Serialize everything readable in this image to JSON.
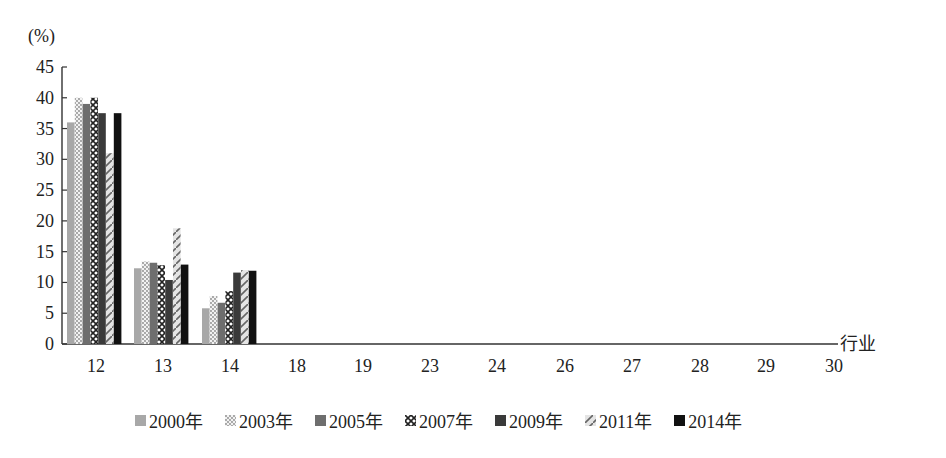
{
  "chart_data": {
    "type": "bar",
    "title": "",
    "ylabel": "(%)",
    "xlabel": "行业",
    "ylim": [
      0,
      45
    ],
    "yticks": [
      0,
      5,
      10,
      15,
      20,
      25,
      30,
      35,
      40,
      45
    ],
    "grid": false,
    "legend_position": "bottom",
    "categories": [
      "12",
      "13",
      "14",
      "18",
      "19",
      "23",
      "24",
      "26",
      "27",
      "28",
      "29",
      "30"
    ],
    "series": [
      {
        "name": "2000年",
        "pattern": "solid-light-gray",
        "color": "#a8a8a8",
        "values": [
          36.0,
          12.3,
          5.8,
          0,
          0,
          0,
          0,
          0,
          0,
          0,
          0,
          0
        ]
      },
      {
        "name": "2003年",
        "pattern": "dotted",
        "color": "#cfcfcf",
        "values": [
          40.0,
          13.4,
          7.8,
          0,
          0,
          0,
          0,
          0,
          0,
          0,
          0,
          0
        ]
      },
      {
        "name": "2005年",
        "pattern": "solid-mid-gray",
        "color": "#6e6e6e",
        "values": [
          39.0,
          13.2,
          6.7,
          0,
          0,
          0,
          0,
          0,
          0,
          0,
          0,
          0
        ]
      },
      {
        "name": "2007年",
        "pattern": "cross-hatch",
        "color": "#555555",
        "values": [
          40.0,
          12.8,
          8.6,
          0,
          0,
          0,
          0,
          0,
          0,
          0,
          0,
          0
        ]
      },
      {
        "name": "2009年",
        "pattern": "solid-dark-gray",
        "color": "#3a3a3a",
        "values": [
          37.5,
          10.4,
          11.6,
          0,
          0,
          0,
          0,
          0,
          0,
          0,
          0,
          0
        ]
      },
      {
        "name": "2011年",
        "pattern": "diagonal",
        "color": "#d8d8d8",
        "values": [
          31.0,
          18.8,
          12.0,
          0,
          0,
          0,
          0,
          0,
          0,
          0,
          0,
          0
        ]
      },
      {
        "name": "2014年",
        "pattern": "solid-black",
        "color": "#111111",
        "values": [
          37.5,
          12.9,
          11.9,
          0,
          0,
          0,
          0,
          0,
          0,
          0,
          0,
          0
        ]
      }
    ]
  }
}
